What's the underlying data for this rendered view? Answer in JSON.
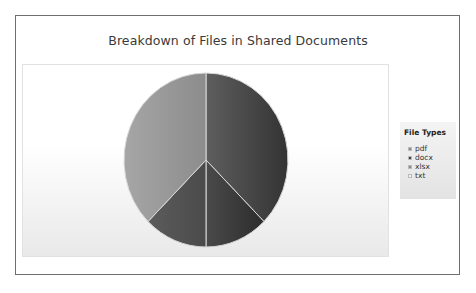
{
  "chart_data": {
    "type": "pie",
    "title": "Breakdown of Files in Shared Documents",
    "legend_title": "File Types",
    "legend_position": "right",
    "categories": [
      "pdf",
      "docx",
      "xlsx",
      "txt"
    ],
    "values": [
      3,
      1,
      1,
      3
    ],
    "percentages": [
      37.5,
      12.5,
      12.5,
      37.5
    ],
    "colors": [
      "#4f4f4f",
      "#3a3a3a",
      "#575757",
      "#9a9a9a"
    ],
    "legend_swatch_colors": [
      "#8a8a8a",
      "#3c3c3c",
      "#8a8a8a",
      "#f0f0f0"
    ]
  },
  "legend": {
    "title": "File Types",
    "items": [
      {
        "label": "pdf"
      },
      {
        "label": "docx"
      },
      {
        "label": "xlsx"
      },
      {
        "label": "txt"
      }
    ]
  }
}
